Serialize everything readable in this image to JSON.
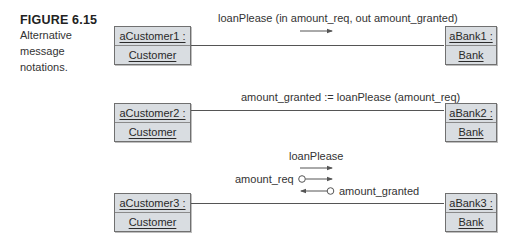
{
  "caption": {
    "figure_number": "FIGURE 6.15",
    "line1": "Alternative",
    "line2": "message",
    "line3": "notations."
  },
  "rows": [
    {
      "left": {
        "instance": "aCustomer1 :",
        "class": "Customer"
      },
      "right": {
        "instance": "aBank1 :",
        "class": "Bank"
      },
      "message": "loanPlease (in amount_req, out amount_granted)"
    },
    {
      "left": {
        "instance": "aCustomer2 :",
        "class": "Customer"
      },
      "right": {
        "instance": "aBank2 :",
        "class": "Bank"
      },
      "message": "amount_granted := loanPlease (amount_req)"
    },
    {
      "left": {
        "instance": "aCustomer3 :",
        "class": "Customer"
      },
      "right": {
        "instance": "aBank3 :",
        "class": "Bank"
      },
      "message": "loanPlease",
      "param_in": "amount_req",
      "param_out": "amount_granted"
    }
  ],
  "colors": {
    "box_fill": "#d9dde1",
    "box_border": "#707070",
    "line": "#555555"
  }
}
